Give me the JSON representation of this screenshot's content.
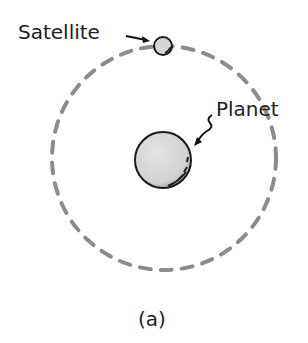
{
  "diagram": {
    "labels": {
      "satellite": "Satellite",
      "planet": "Planet",
      "caption": "(a)"
    },
    "colors": {
      "orbit": "#8c8c8c",
      "body_fill": "#d9d9d9",
      "outline": "#1a1a1a"
    }
  }
}
